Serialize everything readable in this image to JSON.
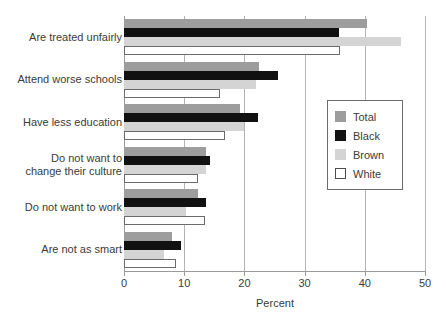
{
  "chart_data": {
    "type": "bar",
    "orientation": "horizontal",
    "title": "",
    "xlabel": "Percent",
    "ylabel": "",
    "xlim": [
      0,
      50
    ],
    "xticks": [
      0,
      10,
      20,
      30,
      40,
      50
    ],
    "grid": "vertical",
    "legend_position": "right-middle",
    "categories": [
      "Are treated unfairly",
      "Attend worse schools",
      "Have less education",
      "Do not want to change their culture",
      "Do not want to work",
      "Are not as smart"
    ],
    "series": [
      {
        "name": "Total",
        "color": "#9d9d9d",
        "values": [
          40.3,
          22.4,
          19.3,
          13.7,
          12.3,
          8.0
        ]
      },
      {
        "name": "Black",
        "color": "#111111",
        "values": [
          35.7,
          25.6,
          22.3,
          14.3,
          13.6,
          9.4
        ]
      },
      {
        "name": "Brown",
        "color": "#d4d4d4",
        "values": [
          46.0,
          22.0,
          20.0,
          13.7,
          10.3,
          6.7
        ]
      },
      {
        "name": "White",
        "color": "#ffffff",
        "values": [
          35.9,
          16.0,
          16.7,
          12.3,
          13.4,
          8.6
        ]
      }
    ]
  },
  "axis": {
    "x_title": "Percent",
    "x_tick_labels": [
      "0",
      "10",
      "20",
      "30",
      "40",
      "50"
    ]
  },
  "category_labels": [
    {
      "line1": "Are treated unfairly",
      "line2": ""
    },
    {
      "line1": "Attend worse schools",
      "line2": ""
    },
    {
      "line1": "Have less education",
      "line2": ""
    },
    {
      "line1": "Do not want to",
      "line2": "change their culture"
    },
    {
      "line1": "Do not want to work",
      "line2": ""
    },
    {
      "line1": "Are not as smart",
      "line2": ""
    }
  ],
  "legend": {
    "entries": [
      {
        "label": "Total",
        "swatch": "total"
      },
      {
        "label": "Black",
        "swatch": "black"
      },
      {
        "label": "Brown",
        "swatch": "brown"
      },
      {
        "label": "White",
        "swatch": "white"
      }
    ]
  },
  "colors": {
    "total": "#9d9d9d",
    "black": "#111111",
    "brown": "#d4d4d4",
    "white": "#ffffff",
    "axis": "#9a9a9a",
    "grid": "#b4b4b4",
    "text": "#3b3b3b"
  }
}
